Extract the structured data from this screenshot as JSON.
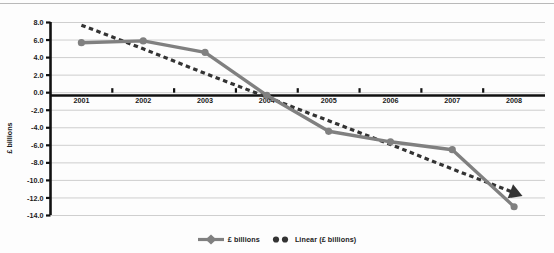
{
  "chart_data": {
    "type": "line",
    "title": "",
    "xlabel": "",
    "ylabel": "£ billions",
    "categories": [
      "2001",
      "2002",
      "2003",
      "2004",
      "2005",
      "2006",
      "2007",
      "2008"
    ],
    "ylim": [
      -14.0,
      8.0
    ],
    "ytick_labels": [
      "8.0",
      "6.0",
      "4.0",
      "2.0",
      "0.0",
      "-2.0",
      "-4.0",
      "-6.0",
      "-8.0",
      "-10.0",
      "-12.0",
      "-14.0"
    ],
    "ytick_values": [
      8.0,
      6.0,
      4.0,
      2.0,
      0.0,
      -2.0,
      -4.0,
      -6.0,
      -8.0,
      -10.0,
      -12.0,
      -14.0
    ],
    "grid": true,
    "legend_position": "bottom",
    "series": [
      {
        "name": "£ billions",
        "style": "solid-markers",
        "color": "#808080",
        "values": [
          5.7,
          5.9,
          4.6,
          -0.3,
          -4.4,
          -5.6,
          -6.5,
          -13.0
        ]
      },
      {
        "name": "Linear (£ billions)",
        "style": "dashed-trendline",
        "color": "#333333",
        "values": [
          7.7,
          5.0,
          2.2,
          -0.5,
          -3.2,
          -5.9,
          -8.7,
          -11.4
        ],
        "annotation": "arrowhead at series end"
      }
    ],
    "colors": {
      "data_series": "#808080",
      "trendline": "#333333",
      "gridline": "#c9c9c9",
      "axis": "#111111",
      "background": "#fdfdfd"
    }
  },
  "legend": {
    "items": [
      {
        "label": "£ billions",
        "marker": "line-diamond-marker"
      },
      {
        "label": "Linear (£ billions)",
        "marker": "dashed-dots-marker"
      }
    ]
  },
  "axes": {
    "y_title": "£ billions"
  }
}
